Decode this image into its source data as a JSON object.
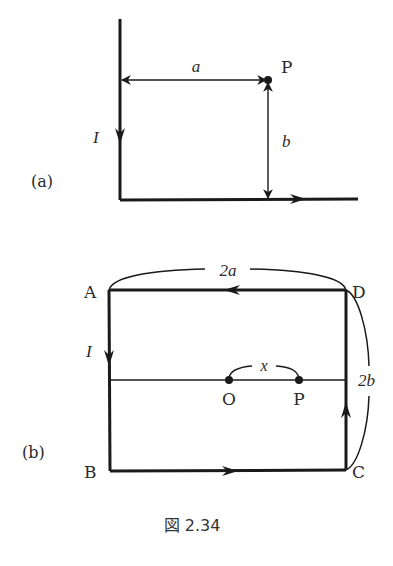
{
  "figure": {
    "caption": "図 2.34",
    "colors": {
      "line": "#1a1a1a",
      "text": "#2a2a2a",
      "background": "#ffffff"
    }
  },
  "panel_a": {
    "label": "(a)",
    "current_label": "I",
    "distance_horizontal_label": "a",
    "distance_vertical_label": "b",
    "point_label": "P"
  },
  "panel_b": {
    "label": "(b)",
    "current_label": "I",
    "corners": {
      "A": "A",
      "B": "B",
      "C": "C",
      "D": "D"
    },
    "width_label": "2a",
    "height_label": "2b",
    "center_label": "O",
    "point_label": "P",
    "offset_label": "x"
  }
}
